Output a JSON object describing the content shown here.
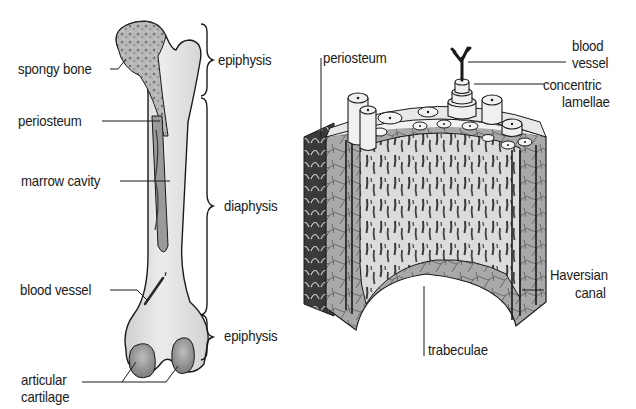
{
  "diagram": {
    "type": "labeled anatomical illustration",
    "left_figure": {
      "subject": "long bone (femur)",
      "labels": {
        "spongy_bone": "spongy bone",
        "periosteum": "periosteum",
        "marrow_cavity": "marrow cavity",
        "blood_vessel": "blood vessel",
        "articular_cartilage_line1": "articular",
        "articular_cartilage_line2": "cartilage"
      },
      "regions": {
        "top": "epiphysis",
        "middle": "diaphysis",
        "bottom": "epiphysis"
      }
    },
    "right_figure": {
      "subject": "compact bone cross-section",
      "labels": {
        "periosteum": "periosteum",
        "blood_vessel_line1": "blood",
        "blood_vessel_line2": "vessel",
        "concentric_line1": "concentric",
        "concentric_line2": "lamellae",
        "haversian_line1": "Haversian",
        "haversian_line2": "canal",
        "trabeculae": "trabeculae"
      }
    },
    "colors": {
      "ink": "#1a1a1a",
      "bone_light": "#e6e6e6",
      "bone_mid": "#bdbdbd",
      "bone_dark": "#7a7a7a",
      "background": "#ffffff"
    }
  }
}
